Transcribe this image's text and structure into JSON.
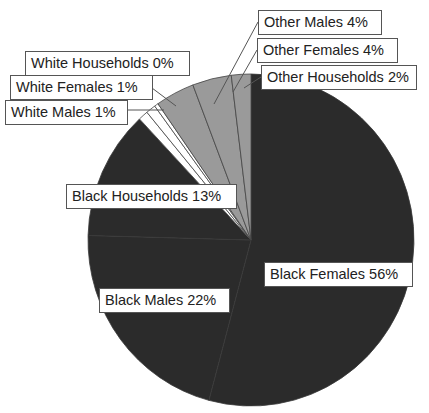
{
  "chart_data": {
    "type": "pie",
    "title": "",
    "start_angle_deg": 0,
    "direction": "clockwise",
    "slices": [
      {
        "name": "Black Females",
        "value": 56,
        "label": "Black Females 56%",
        "color": "#2b2b2b"
      },
      {
        "name": "Black Males",
        "value": 22,
        "label": "Black Males 22%",
        "color": "#2b2b2b"
      },
      {
        "name": "Black Households",
        "value": 13,
        "label": "Black Households 13%",
        "color": "#2b2b2b"
      },
      {
        "name": "White Males",
        "value": 1,
        "label": "White Males 1%",
        "color": "#ffffff"
      },
      {
        "name": "White Females",
        "value": 1,
        "label": "White Females 1%",
        "color": "#ffffff"
      },
      {
        "name": "White Households",
        "value": 0,
        "label": "White Households 0%",
        "color": "#ffffff"
      },
      {
        "name": "Other Males",
        "value": 4,
        "label": "Other Males 4%",
        "color": "#9a9a9a"
      },
      {
        "name": "Other Females",
        "value": 4,
        "label": "Other Females 4%",
        "color": "#9a9a9a"
      },
      {
        "name": "Other Households",
        "value": 2,
        "label": "Other Households 2%",
        "color": "#9a9a9a"
      }
    ],
    "legend": "none",
    "data_labels": "category name and percentage in boxed callouts"
  },
  "labels": {
    "black_females": "Black Females 56%",
    "black_males": "Black Males 22%",
    "black_households": "Black Households 13%",
    "white_males": "White Males 1%",
    "white_females": "White Females 1%",
    "white_households": "White Households 0%",
    "other_males": "Other Males 4%",
    "other_females": "Other Females 4%",
    "other_households": "Other Households 2%"
  }
}
